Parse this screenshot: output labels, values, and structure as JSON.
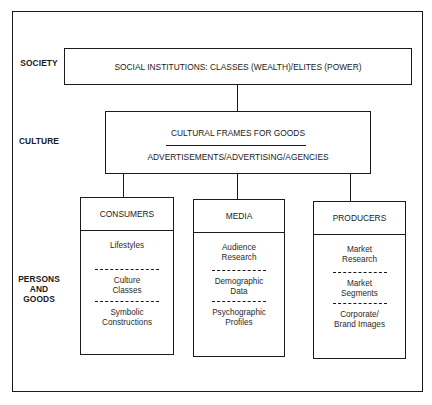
{
  "levels": {
    "society": "SOCIETY",
    "culture": "CULTURE",
    "persons_and_goods": [
      "PERSONS",
      "AND",
      "GOODS"
    ]
  },
  "society_box": {
    "text": "SOCIAL INSTITUTIONS:  CLASSES (WEALTH)/ELITES (POWER)"
  },
  "culture_box": {
    "title": "CULTURAL FRAMES FOR GOODS",
    "subtitle": "ADVERTISEMENTS/ADVERTISING/AGENCIES"
  },
  "columns": [
    {
      "header": "CONSUMERS",
      "items": [
        [
          "Lifestyles"
        ],
        [
          "Culture",
          "Classes"
        ],
        [
          "Symbolic",
          "Constructions"
        ]
      ]
    },
    {
      "header": "MEDIA",
      "items": [
        [
          "Audience",
          "Research"
        ],
        [
          "Demographic",
          "Data"
        ],
        [
          "Psychographic",
          "Profiles"
        ]
      ]
    },
    {
      "header": "PRODUCERS",
      "items": [
        [
          "Market",
          "Research"
        ],
        [
          "Market",
          "Segments"
        ],
        [
          "Corporate/",
          "Brand Images"
        ]
      ]
    }
  ]
}
